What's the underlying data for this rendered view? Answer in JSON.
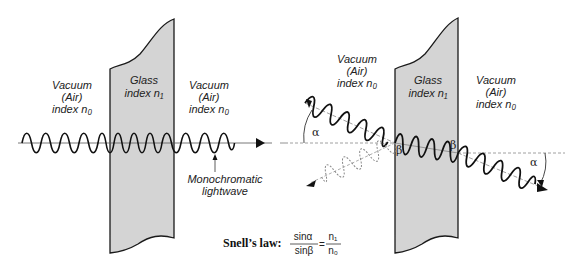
{
  "left_panel": {
    "medium_left": {
      "line1": "Vacuum",
      "line2": "(Air)",
      "line3": "index  n₀"
    },
    "medium_glass": {
      "line1": "Glass",
      "line2": "index  n₁"
    },
    "medium_right": {
      "line1": "Vacuum",
      "line2": "(Air)",
      "line3": "index  n₀"
    },
    "wave_label": {
      "line1": "Monochromatic",
      "line2": "lightwave"
    }
  },
  "right_panel": {
    "medium_left": {
      "line1": "Vacuum",
      "line2": "(Air)",
      "line3": "index  n₀"
    },
    "medium_glass": {
      "line1": "Glass",
      "line2": "index  n₁"
    },
    "medium_right": {
      "line1": "Vacuum",
      "line2": "(Air)",
      "line3": "index  n₀"
    },
    "angle_incident": "α",
    "angle_refracted_in": "β",
    "angle_refracted_out": "β",
    "angle_exit": "α"
  },
  "formula": {
    "title": "Snell’s law:",
    "lhs_num": "sinα",
    "lhs_den": "sinβ",
    "equals": "=",
    "rhs_num": "n₁",
    "rhs_den": "n₀"
  },
  "colors": {
    "glass_fill": "#d4d4d4",
    "outline": "#1a1a1a",
    "dashed": "#888888"
  }
}
